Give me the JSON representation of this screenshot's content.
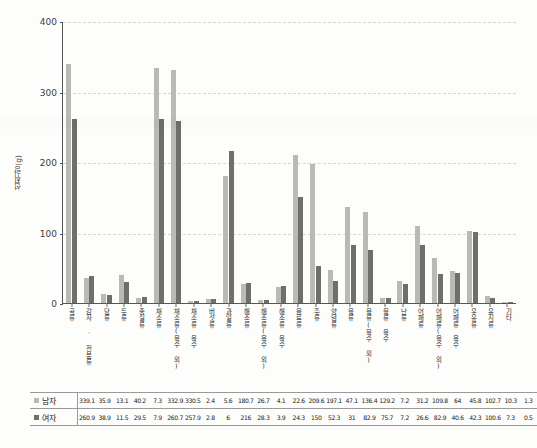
{
  "chart_data": {
    "type": "bar",
    "title": "",
    "xlabel": "",
    "ylabel": "섭취량(g)",
    "ylim": [
      0,
      400
    ],
    "yticks": [
      0,
      100,
      200,
      300,
      400
    ],
    "grid": true,
    "legend_position": "table-left",
    "categories": [
      "곡류",
      "감자 · 전분류",
      "당류",
      "두류",
      "종실류",
      "채소류",
      "채소류(육수 외)",
      "채소류 육수",
      "버섯류",
      "과일류",
      "해조류",
      "해조류(육수 외)",
      "해조류 육수",
      "음료류",
      "주류",
      "양념류",
      "육류",
      "육류(육수 외)",
      "육류 육수",
      "난류",
      "어패류",
      "어패류(육수 외)",
      "어패류 육수",
      "우유류",
      "유지류",
      "기타"
    ],
    "series": [
      {
        "name": "남자",
        "color": "#b9b9b7",
        "values": [
          339.1,
          35.9,
          13.1,
          40.2,
          7.3,
          332.9,
          330.5,
          2.4,
          5.6,
          180.7,
          26.7,
          4.1,
          22.6,
          209.6,
          197.1,
          47.1,
          136.4,
          129.2,
          7.2,
          31.2,
          109.8,
          64,
          45.8,
          102.7,
          10.3,
          1.3
        ]
      },
      {
        "name": "여자",
        "color": "#6e6e6c",
        "values": [
          260.9,
          38.9,
          11.5,
          29.5,
          7.9,
          260.7,
          257.9,
          2.8,
          6,
          216,
          28.3,
          3.9,
          24.3,
          150,
          52.3,
          31,
          82.9,
          75.7,
          7.2,
          26.6,
          82.9,
          40.6,
          42.3,
          100.6,
          7.3,
          0.5
        ]
      }
    ]
  },
  "legend": {
    "male_label": "남자",
    "female_label": "여자",
    "male_color": "#b9b9b7",
    "female_color": "#6e6e6c"
  }
}
